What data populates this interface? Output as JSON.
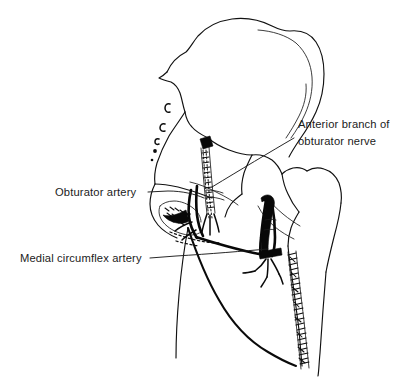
{
  "figure": {
    "kind": "anatomical-line-drawing",
    "background_color": "#ffffff",
    "ink_color": "#111111",
    "width": 416,
    "height": 391
  },
  "labels": [
    {
      "id": "anterior-branch-obturator-nerve",
      "lines": [
        "Anterior branch of",
        "obturator nerve"
      ],
      "line1": "Anterior branch of",
      "line2": "obturator nerve",
      "x": 298,
      "y": 128,
      "anchor": "start",
      "leader_from": [
        294,
        136
      ],
      "leader_to": [
        205,
        187
      ]
    },
    {
      "id": "obturator-artery",
      "lines": [
        "Obturator artery"
      ],
      "line1": "Obturator artery",
      "x": 55,
      "y": 196,
      "anchor": "start",
      "leader_from": [
        148,
        192
      ],
      "leader_to": [
        202,
        198
      ]
    },
    {
      "id": "medial-circumflex-artery",
      "lines": [
        "Medial circumflex artery"
      ],
      "line1": "Medial circumflex artery",
      "x": 20,
      "y": 262,
      "anchor": "start",
      "leader_from": [
        150,
        258
      ],
      "leader_to": [
        268,
        250
      ]
    }
  ],
  "structures": [
    {
      "id": "iliac-wing",
      "name": "Iliac wing and crest"
    },
    {
      "id": "anterior-superior-iliac-spine",
      "name": "Anterior superior iliac spine"
    },
    {
      "id": "acetabulum",
      "name": "Acetabulum"
    },
    {
      "id": "femoral-head",
      "name": "Femoral head"
    },
    {
      "id": "greater-trochanter",
      "name": "Greater trochanter"
    },
    {
      "id": "femoral-neck",
      "name": "Femoral neck"
    },
    {
      "id": "femoral-shaft",
      "name": "Femoral shaft"
    },
    {
      "id": "obturator-foramen",
      "name": "Obturator foramen"
    },
    {
      "id": "superior-pubic-ramus",
      "name": "Superior pubic ramus"
    },
    {
      "id": "ischiopubic-ramus",
      "name": "Ischiopubic ramus"
    },
    {
      "id": "obturator-nerve-bundle",
      "name": "Obturator nerve bundle"
    },
    {
      "id": "obturator-artery-vessel",
      "name": "Obturator artery"
    },
    {
      "id": "medial-circumflex-vessel",
      "name": "Medial circumflex femoral artery"
    },
    {
      "id": "sacral-stipple",
      "name": "Sacral margin stipple marks"
    },
    {
      "id": "shaft-hatching",
      "name": "Femoral shaft hatched band"
    }
  ]
}
